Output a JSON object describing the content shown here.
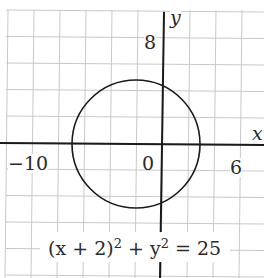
{
  "chart_data": {
    "type": "line",
    "title": "",
    "equation": "(x + 2)^2 + y^2 = 25",
    "xlabel": "x",
    "ylabel": "y",
    "xlim": [
      -12,
      7
    ],
    "ylim": [
      -10,
      10
    ],
    "grid": true,
    "grid_step": 2,
    "tick_labels": {
      "x": [
        "-10",
        "0",
        "6"
      ],
      "y": [
        "8"
      ]
    },
    "series": [
      {
        "name": "circle",
        "shape": "circle",
        "center": [
          -2,
          0
        ],
        "radius": 5
      }
    ]
  },
  "labels": {
    "x_axis": "x",
    "y_axis": "y",
    "tick_neg10": "−10",
    "tick_0": "0",
    "tick_6": "6",
    "tick_8": "8",
    "eq_part1": "(x + 2)",
    "eq_sup1": "2",
    "eq_part2": " + y",
    "eq_sup2": "2",
    "eq_part3": " = 25"
  }
}
